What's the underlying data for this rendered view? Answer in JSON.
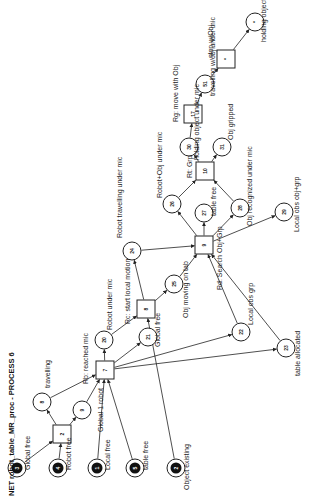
{
  "title": "NET robot_table_MR_proc - PROCESS 6",
  "colors": {
    "stroke": "#222222",
    "token": "#111111",
    "background": "#ffffff"
  },
  "places": [
    {
      "id": "3",
      "x": 17,
      "y": 468,
      "marked": true,
      "label": "Global free",
      "lx": 30,
      "ly": 470
    },
    {
      "id": "4",
      "x": 58,
      "y": 468,
      "marked": true,
      "label": "Robot free",
      "lx": 71,
      "ly": 470
    },
    {
      "id": "1",
      "x": 97,
      "y": 468,
      "marked": true,
      "label": "Local free",
      "lx": 110,
      "ly": 470
    },
    {
      "id": "5",
      "x": 135,
      "y": 468,
      "marked": true,
      "label": "table free",
      "lx": 148,
      "ly": 470
    },
    {
      "id": "2",
      "x": 176,
      "y": 468,
      "marked": true,
      "label": "Object existing",
      "lx": 189,
      "ly": 490
    },
    {
      "id": "8",
      "x": 42,
      "y": 402,
      "marked": false,
      "label": "travelling",
      "lx": 50,
      "ly": 388
    },
    {
      "id": "9",
      "x": 82,
      "y": 410,
      "marked": false,
      "label": "Global 1 robot",
      "lx": 103,
      "ly": 432
    },
    {
      "id": "20",
      "x": 104,
      "y": 340,
      "marked": false,
      "label": "Robot under mic",
      "lx": 112,
      "ly": 330
    },
    {
      "id": "21",
      "x": 148,
      "y": 337,
      "marked": false,
      "label": "Global free",
      "lx": 160,
      "ly": 347
    },
    {
      "id": "24",
      "x": 132,
      "y": 251,
      "marked": false,
      "label": "Robot travelling under mic",
      "lx": 122,
      "ly": 238
    },
    {
      "id": "25",
      "x": 174,
      "y": 284,
      "marked": false,
      "label": "Obj moving on tab",
      "lx": 188,
      "ly": 318
    },
    {
      "id": "22",
      "x": 241,
      "y": 332,
      "marked": false,
      "label": "Local obs grp",
      "lx": 253,
      "ly": 325
    },
    {
      "id": "23",
      "x": 286,
      "y": 348,
      "marked": false,
      "label": "table allocated",
      "lx": 300,
      "ly": 376
    },
    {
      "id": "26",
      "x": 172,
      "y": 204,
      "marked": false,
      "label": "Robot+Obj under mic",
      "lx": 162,
      "ly": 198
    },
    {
      "id": "27",
      "x": 204,
      "y": 213,
      "marked": false,
      "label": "table free",
      "lx": 216,
      "ly": 216
    },
    {
      "id": "28",
      "x": 240,
      "y": 208,
      "marked": false,
      "label": "Obj recognized under mic",
      "lx": 252,
      "ly": 226
    },
    {
      "id": "29",
      "x": 284,
      "y": 212,
      "marked": false,
      "label": "Local obs obj+grp",
      "lx": 299,
      "ly": 232
    },
    {
      "id": "30",
      "x": 189,
      "y": 147,
      "marked": false,
      "label": "holding object under mic",
      "lx": 199,
      "ly": 160
    },
    {
      "id": "31",
      "x": 222,
      "y": 147,
      "marked": false,
      "label": "Obj gripped",
      "lx": 233,
      "ly": 140
    },
    {
      "id": "51",
      "x": 205,
      "y": 84,
      "marked": false,
      "label": "travelling w/obj under mic",
      "lx": 215,
      "ly": 96
    },
    {
      "id": "*",
      "x": 255,
      "y": 22,
      "marked": false,
      "label": "holding object under mic",
      "lx": 266,
      "ly": 42
    }
  ],
  "transitions": [
    {
      "id": "2",
      "x": 62,
      "y": 434,
      "label": "",
      "lx": 0,
      "ly": 0
    },
    {
      "id": "7",
      "x": 105,
      "y": 370,
      "label": "Rb: reached mic",
      "lx": 88,
      "ly": 384
    },
    {
      "id": "8",
      "x": 146,
      "y": 309,
      "label": "Rc: start local motion",
      "lx": 130,
      "ly": 324
    },
    {
      "id": "9",
      "x": 204,
      "y": 245,
      "label": "Rd: Search Obj+Grp",
      "lx": 222,
      "ly": 290
    },
    {
      "id": "10",
      "x": 205,
      "y": 171,
      "label": "Rt: Grp",
      "lx": 192,
      "ly": 178
    },
    {
      "id": "17",
      "x": 193,
      "y": 114,
      "label": "Rg: move with Obj",
      "lx": 178,
      "ly": 122
    },
    {
      "id": "*",
      "x": 226,
      "y": 59,
      "label": "stop w/Obj",
      "lx": 213,
      "ly": 58
    }
  ],
  "arcs": [
    [
      "p3",
      "t2"
    ],
    [
      "p4",
      "t2"
    ],
    [
      "t2",
      "p8"
    ],
    [
      "t2",
      "p9"
    ],
    [
      "p8",
      "t7"
    ],
    [
      "p9",
      "t7"
    ],
    [
      "p1",
      "t7"
    ],
    [
      "p5",
      "t7"
    ],
    [
      "t7",
      "p20"
    ],
    [
      "t7",
      "p21"
    ],
    [
      "t7",
      "p22"
    ],
    [
      "t7",
      "p23"
    ],
    [
      "p20",
      "t8"
    ],
    [
      "p2",
      "t8"
    ],
    [
      "t8",
      "p24"
    ],
    [
      "t8",
      "p25"
    ],
    [
      "p24",
      "t9"
    ],
    [
      "p25",
      "t9"
    ],
    [
      "p22",
      "t9"
    ],
    [
      "p23",
      "t9"
    ],
    [
      "t9",
      "p26"
    ],
    [
      "t9",
      "p27"
    ],
    [
      "t9",
      "p28"
    ],
    [
      "t9",
      "p29"
    ],
    [
      "p26",
      "t10"
    ],
    [
      "p28",
      "t10"
    ],
    [
      "t10",
      "p30"
    ],
    [
      "t10",
      "p31"
    ],
    [
      "p30",
      "t17"
    ],
    [
      "t17",
      "p51"
    ],
    [
      "p51",
      "t*"
    ],
    [
      "t*",
      "p*"
    ]
  ]
}
